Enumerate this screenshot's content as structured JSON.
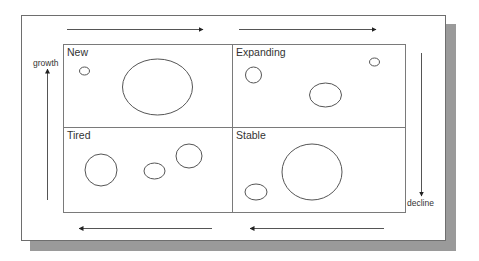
{
  "diagram": {
    "type": "portfolio-matrix",
    "quadrants": [
      {
        "id": "new",
        "label": "New",
        "position": "top-left",
        "bubbles": [
          {
            "size": "small"
          },
          {
            "size": "large"
          }
        ]
      },
      {
        "id": "expanding",
        "label": "Expanding",
        "position": "top-right",
        "bubbles": [
          {
            "size": "medium-small"
          },
          {
            "size": "small"
          },
          {
            "size": "medium"
          }
        ]
      },
      {
        "id": "tired",
        "label": "Tired",
        "position": "bottom-left",
        "bubbles": [
          {
            "size": "medium"
          },
          {
            "size": "small"
          },
          {
            "size": "medium"
          }
        ]
      },
      {
        "id": "stable",
        "label": "Stable",
        "position": "bottom-right",
        "bubbles": [
          {
            "size": "small"
          },
          {
            "size": "large"
          }
        ]
      }
    ],
    "axis_labels": {
      "growth": "growth",
      "decline": "decline"
    },
    "flow_arrows": [
      {
        "id": "top-left-arrow",
        "direction": "right"
      },
      {
        "id": "top-right-arrow",
        "direction": "right"
      },
      {
        "id": "right-arrow",
        "direction": "down"
      },
      {
        "id": "bottom-right-arrow",
        "direction": "left"
      },
      {
        "id": "bottom-left-arrow",
        "direction": "left"
      },
      {
        "id": "left-arrow",
        "direction": "up"
      }
    ],
    "colors": {
      "line": "#555555",
      "grid": "#7a7a7a",
      "shadow": "#9a9a9a",
      "text": "#333333"
    }
  }
}
